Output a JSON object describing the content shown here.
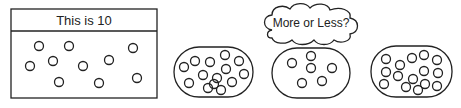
{
  "reference_box": {
    "label": "This is 10",
    "count": 10
  },
  "cloud": {
    "label": "More or Less?"
  },
  "ovals": [
    {
      "name": "oval-left",
      "count": 14
    },
    {
      "name": "oval-middle",
      "count": 6
    },
    {
      "name": "oval-right",
      "count": 15
    }
  ],
  "colors": {
    "stroke": "#222222",
    "background": "#ffffff"
  }
}
